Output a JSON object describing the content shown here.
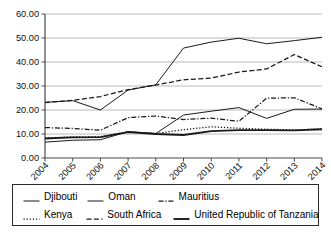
{
  "chart_data": {
    "type": "line",
    "title": "",
    "subtitle": "",
    "xlabel": "",
    "ylabel": "",
    "x": [
      "2004",
      "2005",
      "2006",
      "2007",
      "2008",
      "2009",
      "2010",
      "2011",
      "2012",
      "2013",
      "2014"
    ],
    "categories": [
      "2004",
      "2005",
      "2006",
      "2007",
      "2008",
      "2009",
      "2010",
      "2011",
      "2012",
      "2013",
      "2014"
    ],
    "ylim": [
      0,
      60
    ],
    "ytick_labels": [
      "0.00",
      "10.00",
      "20.00",
      "30.00",
      "40.00",
      "50.00",
      "60.00"
    ],
    "ytick_values": [
      0,
      10,
      20,
      30,
      40,
      50,
      60
    ],
    "grid": true,
    "legend_position": "bottom",
    "series": [
      {
        "name": "Djibouti",
        "style": "solid",
        "color": "#1a1a1a",
        "values": [
          23.2,
          23.9,
          20.0,
          28.3,
          30.5,
          45.8,
          48.3,
          49.9,
          47.6,
          48.9,
          50.3
        ]
      },
      {
        "name": "Oman",
        "style": "solid",
        "color": "#1a1a1a",
        "values": [
          6.6,
          7.4,
          7.6,
          11.0,
          10.2,
          17.9,
          19.5,
          21.0,
          16.5,
          20.3,
          20.4
        ]
      },
      {
        "name": "Mauritius",
        "style": "dash-dot",
        "color": "#1a1a1a",
        "values": [
          12.7,
          12.3,
          11.6,
          16.8,
          17.5,
          16.0,
          16.6,
          15.3,
          24.9,
          25.1,
          20.5
        ]
      },
      {
        "name": "Kenya",
        "style": "dotted",
        "color": "#1a1a1a",
        "values": [
          8.4,
          8.8,
          8.9,
          10.9,
          10.2,
          11.8,
          13.0,
          12.4,
          12.0,
          11.7,
          12.1
        ]
      },
      {
        "name": "South Africa",
        "style": "dashed",
        "color": "#1a1a1a",
        "values": [
          23.1,
          24.0,
          25.6,
          28.5,
          30.4,
          32.6,
          33.3,
          35.8,
          37.1,
          43.1,
          38.0
        ]
      },
      {
        "name": "United Republic of Tanzania",
        "style": "thick-solid",
        "color": "#1a1a1a",
        "values": [
          8.1,
          8.6,
          8.7,
          10.8,
          10.0,
          9.6,
          11.2,
          11.6,
          11.6,
          11.5,
          12.0
        ]
      }
    ]
  },
  "legend": {
    "rows": [
      [
        {
          "label": "Djibouti",
          "style": "solid"
        },
        {
          "label": "Oman",
          "style": "solid"
        },
        {
          "label": "Mauritius",
          "style": "dash-dot"
        }
      ],
      [
        {
          "label": "Kenya",
          "style": "dotted"
        },
        {
          "label": "South Africa",
          "style": "dashed"
        },
        {
          "label": "United Republic of Tanzania",
          "style": "thick-solid"
        }
      ]
    ]
  }
}
